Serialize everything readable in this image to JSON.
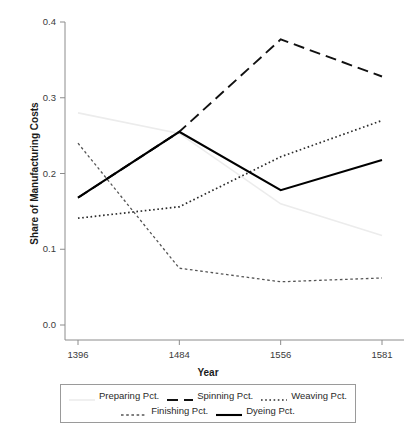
{
  "chart_data": {
    "type": "line",
    "title": "",
    "xlabel": "Year",
    "ylabel": "Share of Manufacturing Costs",
    "categories": [
      "1396",
      "1484",
      "1556",
      "1581"
    ],
    "xticklabels": [
      "1396",
      "1484",
      "1556",
      "1581"
    ],
    "yticklabels": [
      "0.0",
      "0.1",
      "0.2",
      "0.3",
      "0.4"
    ],
    "yticks": [
      0.0,
      0.1,
      0.2,
      0.3,
      0.4
    ],
    "ylim": [
      0.0,
      0.4
    ],
    "grid": false,
    "legend_position": "below-axes",
    "series": [
      {
        "name": "Preparing Pct.",
        "values": [
          0.28,
          0.253,
          0.16,
          0.118
        ],
        "linestyle": "solid",
        "color": "#ececec",
        "width": 1.6
      },
      {
        "name": "Spinning Pct.",
        "values": [
          0.168,
          0.255,
          0.377,
          0.328
        ],
        "linestyle": "dashed",
        "color": "#111111",
        "width": 1.9
      },
      {
        "name": "Weaving Pct.",
        "values": [
          0.141,
          0.156,
          0.222,
          0.27
        ],
        "linestyle": "dotted",
        "color": "#2b2b2b",
        "width": 1.7
      },
      {
        "name": "Finishing Pct.",
        "values": [
          0.24,
          0.075,
          0.057,
          0.062
        ],
        "linestyle": "fine-dashed",
        "color": "#555555",
        "width": 1.3
      },
      {
        "name": "Dyeing Pct.",
        "values": [
          0.168,
          0.255,
          0.178,
          0.218
        ],
        "linestyle": "solid",
        "color": "#000000",
        "width": 2.1
      }
    ]
  },
  "legend": {
    "rows": [
      [
        "Preparing Pct.",
        "Spinning Pct.",
        "Weaving Pct."
      ],
      [
        "Finishing Pct.",
        "Dyeing Pct."
      ]
    ]
  },
  "axes": {
    "axis_color": "#8c8c8c"
  }
}
